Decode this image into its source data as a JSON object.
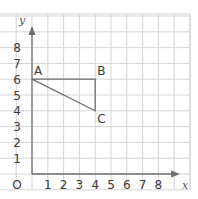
{
  "chart_data": {
    "type": "scatter",
    "title": "",
    "xlabel": "x",
    "ylabel": "y",
    "origin_label": "O",
    "x_ticks": [
      "1",
      "2",
      "3",
      "4",
      "5",
      "6",
      "7",
      "8"
    ],
    "y_ticks": [
      "1",
      "2",
      "3",
      "4",
      "5",
      "6",
      "7",
      "8"
    ],
    "xlim": [
      0,
      10
    ],
    "ylim": [
      0,
      10
    ],
    "grid": true,
    "shape": "triangle",
    "points": [
      {
        "label": "A",
        "x": 0,
        "y": 6
      },
      {
        "label": "B",
        "x": 4,
        "y": 6
      },
      {
        "label": "C",
        "x": 4,
        "y": 4
      }
    ],
    "edges": [
      [
        "A",
        "B"
      ],
      [
        "B",
        "C"
      ],
      [
        "C",
        "A"
      ]
    ]
  },
  "colors": {
    "grid": "#d4d4d4",
    "axis": "#6e6e6e",
    "shape": "#6e6e6e",
    "text": "#3a3a3a"
  }
}
